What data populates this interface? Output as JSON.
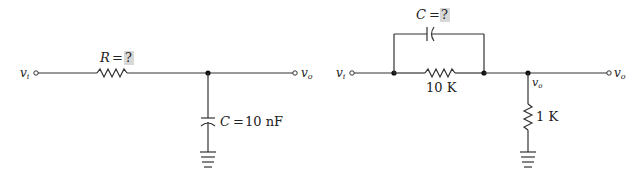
{
  "diagrams": [
    {
      "id": "rc-lowpass",
      "input_label": "v",
      "input_sub": "i",
      "output_label": "v",
      "output_sub": "o",
      "resistor": {
        "name": "R",
        "eq": "=",
        "value": "?"
      },
      "capacitor": {
        "name": "C",
        "eq": "=",
        "value": "10 nF"
      }
    },
    {
      "id": "compensated-divider",
      "input_label": "v",
      "input_sub": "i",
      "output_label": "v",
      "output_sub": "o",
      "node_label": "v",
      "node_sub": "o",
      "capacitor": {
        "name": "C",
        "eq": "=",
        "value": "?"
      },
      "series_resistor": {
        "value": "10 K"
      },
      "shunt_resistor": {
        "value": "1 K"
      }
    }
  ],
  "colors": {
    "wire": "#333333",
    "unknown_highlight": "#d8d8d8",
    "background": "#ffffff"
  }
}
